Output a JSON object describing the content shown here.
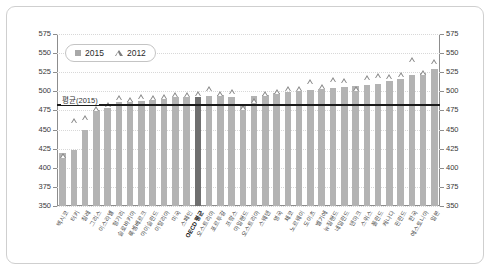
{
  "chart_data": {
    "type": "bar",
    "title": "",
    "xlabel": "",
    "ylabel": "",
    "ylim": [
      350,
      575
    ],
    "ytick_step": 25,
    "yticks": [
      575,
      550,
      525,
      500,
      475,
      450,
      425,
      400,
      375,
      350
    ],
    "grid": true,
    "legend_position": "top-left",
    "legend": [
      {
        "label": "2015",
        "marker": "filled-square",
        "color": "#a8a8a8"
      },
      {
        "label": "2012",
        "marker": "open-triangle",
        "color": "#7d7d7d"
      }
    ],
    "annotations": [
      {
        "label": "평균(2015)",
        "type": "hline",
        "value": 484
      }
    ],
    "highlight_category": "OECD 평균",
    "categories": [
      "멕시코",
      "터키",
      "칠레",
      "그리스",
      "이스라엘",
      "헝가리",
      "슬로바키아",
      "룩셈베르크",
      "아이슬란드",
      "이탈리아",
      "미국",
      "스페인",
      "OECD 평균",
      "오스트리아",
      "포르투갈",
      "프랑스",
      "아일랜드",
      "오스트리아",
      "스웨덴",
      "영국",
      "체코",
      "노르웨이",
      "도이츠",
      "벨기에",
      "뉴질랜드",
      "네덜란드",
      "덴마크",
      "스위스",
      "폴란드",
      "캐나다",
      "핀란드",
      "한국",
      "에스토니아",
      "일본"
    ],
    "series": [
      {
        "name": "2015",
        "marker": "bar",
        "values": [
          420,
          423,
          450,
          475,
          478,
          486,
          487,
          488,
          489,
          490,
          492,
          492,
          493,
          494,
          495,
          493,
          482,
          494,
          495,
          498,
          499,
          500,
          502,
          503,
          505,
          506,
          507,
          508,
          510,
          513,
          516,
          522,
          524,
          529
        ]
      },
      {
        "name": "2012",
        "marker": "triangle",
        "values": [
          413,
          459,
          463,
          474,
          479,
          489,
          486,
          490,
          489,
          490,
          492,
          493,
          494,
          501,
          494,
          496,
          475,
          485,
          494,
          497,
          500,
          500,
          509,
          503,
          512,
          511,
          500,
          515,
          518,
          516,
          519,
          538,
          521,
          536
        ]
      }
    ]
  }
}
